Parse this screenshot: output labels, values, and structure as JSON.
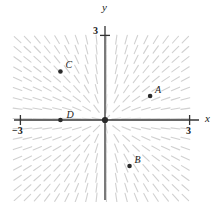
{
  "figure": {
    "title": "",
    "type": "slope-field"
  },
  "axes": {
    "x_label": "x",
    "y_label": "y",
    "x_ticks": [
      {
        "label": "−3",
        "value": -3
      },
      {
        "label": "3",
        "value": 3
      }
    ],
    "y_ticks": [
      {
        "label": "3",
        "value": 3
      }
    ],
    "origin_label": "",
    "xlim": [
      -3.3,
      3.3
    ],
    "ylim": [
      -3.3,
      3.3
    ],
    "grid": false
  },
  "points": [
    {
      "label": "A",
      "x": 1.6,
      "y": 0.85,
      "label_dx": 5,
      "label_dy": -11
    },
    {
      "label": "B",
      "x": 0.87,
      "y": -1.63,
      "label_dx": 5,
      "label_dy": -11
    },
    {
      "label": "C",
      "x": -1.58,
      "y": 1.72,
      "label_dx": 5,
      "label_dy": -11
    },
    {
      "label": "D",
      "x": -1.58,
      "y": 0.0,
      "label_dx": 6,
      "label_dy": -10
    },
    {
      "label": "",
      "x": 0.0,
      "y": 0.0,
      "label_dx": 0,
      "label_dy": 0
    }
  ],
  "chart_data": {
    "type": "scatter",
    "title": "",
    "xlabel": "x",
    "ylabel": "y",
    "xlim": [
      -3.3,
      3.3
    ],
    "ylim": [
      -3.3,
      3.3
    ],
    "grid": false,
    "slope_field": {
      "equation": "dy/dx = y/x",
      "x_range": [
        -3.1,
        3.1
      ],
      "y_range": [
        -3.1,
        3.1
      ],
      "step": 0.35,
      "segment_color": "#c9c9c9",
      "segment_length_px": 9
    },
    "categories": [
      "A",
      "B",
      "C",
      "D",
      "origin"
    ],
    "x": [
      1.6,
      0.87,
      -1.58,
      -1.58,
      0.0
    ],
    "y": [
      0.85,
      -1.63,
      1.72,
      0.0,
      0.0
    ],
    "annotations": [
      "A",
      "B",
      "C",
      "D",
      ""
    ]
  },
  "colors": {
    "axis": "#333333",
    "point": "#2b2b2b",
    "slope_mark": "#cccccc",
    "background": "#ffffff"
  }
}
